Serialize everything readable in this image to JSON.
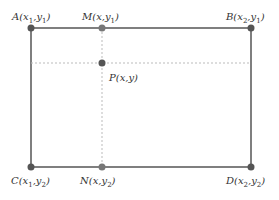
{
  "diagram": {
    "type": "rectangle-interpolation",
    "colors": {
      "line": "#555555",
      "dash": "#bbbbbb",
      "point": "#555555",
      "text": "#333333"
    },
    "points": {
      "A": {
        "name": "A",
        "x": "x",
        "y": "y",
        "xs": "1",
        "ys": "1"
      },
      "M": {
        "name": "M",
        "x": "x",
        "xs": "",
        "ys": "1"
      },
      "B": {
        "name": "B",
        "xs": "2",
        "ys": "1"
      },
      "P": {
        "name": "P"
      },
      "C": {
        "name": "C",
        "xs": "1",
        "ys": "2"
      },
      "N": {
        "name": "N",
        "ys": "2"
      },
      "D": {
        "name": "D",
        "xs": "2",
        "ys": "2"
      }
    },
    "labels": {
      "A_pre": "A(x",
      "A_s1": "1",
      "A_mid": ",y",
      "A_s2": "1",
      "A_post": ")",
      "M_pre": "M(x,y",
      "M_s": "1",
      "M_post": ")",
      "B_pre": "B(x",
      "B_s1": "2",
      "B_mid": ",y",
      "B_s2": "1",
      "B_post": ")",
      "P": "P(x,y)",
      "C_pre": "C(x",
      "C_s1": "1",
      "C_mid": ",y",
      "C_s2": "2",
      "C_post": ")",
      "N_pre": "N(x,y",
      "N_s": "2",
      "N_post": ")",
      "D_pre": "D(x",
      "D_s1": "2",
      "D_mid": ",y",
      "D_s2": "2",
      "D_post": ")"
    }
  }
}
